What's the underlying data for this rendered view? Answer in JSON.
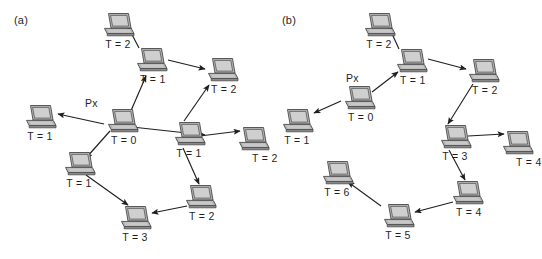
{
  "figure": {
    "width": 537,
    "height": 259,
    "background": "#ffffff",
    "ink": "#1f1f1f",
    "node_icon": "laptop-icon",
    "node_colors": {
      "case": "#b5b5b5",
      "case_shadow": "#8e8e8e",
      "screen": "#cfcfcf",
      "outline": "#4a4a4a"
    }
  },
  "panels": [
    {
      "id": "a",
      "label": "(a)",
      "origin_tag": "Px",
      "nodes": [
        {
          "id": "a-t2-top",
          "label": "T = 2",
          "x": 101,
          "y": 12,
          "label_pos": "center"
        },
        {
          "id": "a-t1-upper",
          "label": "T = 1",
          "x": 134,
          "y": 47,
          "label_pos": "right"
        },
        {
          "id": "a-t2-right",
          "label": "T = 2",
          "x": 205,
          "y": 57,
          "label_pos": "right"
        },
        {
          "id": "a-t1-left",
          "label": "T = 1",
          "x": 23,
          "y": 104,
          "label_pos": "center"
        },
        {
          "id": "a-t0-px",
          "label": "T = 0",
          "x": 105,
          "y": 108,
          "label_pos": "right"
        },
        {
          "id": "a-t1-mid",
          "label": "T = 1",
          "x": 172,
          "y": 121,
          "label_pos": "center"
        },
        {
          "id": "a-t2-far",
          "label": "T = 2",
          "x": 236,
          "y": 126,
          "label_pos": "farright"
        },
        {
          "id": "a-t1-lower",
          "label": "T = 1",
          "x": 62,
          "y": 151,
          "label_pos": "center"
        },
        {
          "id": "a-t2-bottom",
          "label": "T = 2",
          "x": 183,
          "y": 184,
          "label_pos": "right"
        },
        {
          "id": "a-t3",
          "label": "T = 3",
          "x": 118,
          "y": 205,
          "label_pos": "center"
        }
      ],
      "px_tag_pos": {
        "x": 85,
        "y": 97
      },
      "label_pos": {
        "x": 14,
        "y": 14
      },
      "edges": [
        {
          "from": "a-t0-px",
          "to": "a-t1-upper",
          "x1": 130,
          "y1": 113,
          "x2": 146,
          "y2": 76
        },
        {
          "from": "a-t1-upper",
          "to": "a-t2-top",
          "x1": 139,
          "y1": 48,
          "x2": 127,
          "y2": 25
        },
        {
          "from": "a-t1-upper",
          "to": "a-t2-right",
          "x1": 168,
          "y1": 60,
          "x2": 205,
          "y2": 69
        },
        {
          "from": "a-t0-px",
          "to": "a-t1-left",
          "x1": 104,
          "y1": 124,
          "x2": 58,
          "y2": 114
        },
        {
          "from": "a-t0-px",
          "to": "a-t1-mid",
          "x1": 132,
          "y1": 127,
          "x2": 205,
          "y2": 135
        },
        {
          "from": "a-t1-mid",
          "to": "a-t2-right",
          "x1": 184,
          "y1": 121,
          "x2": 209,
          "y2": 85
        },
        {
          "from": "a-t1-mid",
          "to": "a-t2-far",
          "x1": 200,
          "y1": 136,
          "x2": 240,
          "y2": 131
        },
        {
          "from": "a-t0-px",
          "to": "a-t1-lower",
          "x1": 110,
          "y1": 131,
          "x2": 86,
          "y2": 158
        },
        {
          "from": "a-t1-mid",
          "to": "a-t2-bottom",
          "x1": 183,
          "y1": 148,
          "x2": 199,
          "y2": 184
        },
        {
          "from": "a-t1-lower",
          "to": "a-t3",
          "x1": 86,
          "y1": 175,
          "x2": 128,
          "y2": 205
        },
        {
          "from": "a-t2-bottom",
          "to": "a-t3",
          "x1": 187,
          "y1": 206,
          "x2": 152,
          "y2": 213
        }
      ]
    },
    {
      "id": "b",
      "label": "(b)",
      "origin_tag": "Px",
      "nodes": [
        {
          "id": "b-t2-top",
          "label": "T = 2",
          "x": 94,
          "y": 12,
          "label_pos": "center"
        },
        {
          "id": "b-t1",
          "label": "T = 1",
          "x": 126,
          "y": 48,
          "label_pos": "right"
        },
        {
          "id": "b-t2-right",
          "label": "T = 2",
          "x": 198,
          "y": 58,
          "label_pos": "right"
        },
        {
          "id": "b-t0-px",
          "label": "T = 0",
          "x": 74,
          "y": 85,
          "label_pos": "right"
        },
        {
          "id": "b-t1-left",
          "label": "T = 1",
          "x": 12,
          "y": 108,
          "label_pos": "center"
        },
        {
          "id": "b-t3",
          "label": "T = 3",
          "x": 170,
          "y": 124,
          "label_pos": "center"
        },
        {
          "id": "b-t4-right",
          "label": "T = 4",
          "x": 232,
          "y": 130,
          "label_pos": "farright"
        },
        {
          "id": "b-t6",
          "label": "T = 6",
          "x": 52,
          "y": 160,
          "label_pos": "center"
        },
        {
          "id": "b-t4-bot",
          "label": "T = 4",
          "x": 182,
          "y": 180,
          "label_pos": "right"
        },
        {
          "id": "b-t5",
          "label": "T = 5",
          "x": 113,
          "y": 203,
          "label_pos": "center"
        }
      ],
      "px_tag_pos": {
        "x": 78,
        "y": 72
      },
      "label_pos": {
        "x": 14,
        "y": 14
      },
      "edges": [
        {
          "from": "b-t0-px",
          "to": "b-t1",
          "x1": 104,
          "y1": 92,
          "x2": 130,
          "y2": 72
        },
        {
          "from": "b-t1",
          "to": "b-t2-top",
          "x1": 131,
          "y1": 49,
          "x2": 120,
          "y2": 25
        },
        {
          "from": "b-t1",
          "to": "b-t2-right",
          "x1": 160,
          "y1": 59,
          "x2": 198,
          "y2": 69
        },
        {
          "from": "b-t0-px",
          "to": "b-t1-left",
          "x1": 73,
          "y1": 101,
          "x2": 46,
          "y2": 113
        },
        {
          "from": "b-t2-right",
          "to": "b-t3",
          "x1": 205,
          "y1": 84,
          "x2": 180,
          "y2": 124
        },
        {
          "from": "b-t3",
          "to": "b-t4-right",
          "x1": 200,
          "y1": 136,
          "x2": 236,
          "y2": 134
        },
        {
          "from": "b-t3",
          "to": "b-t4-bot",
          "x1": 181,
          "y1": 150,
          "x2": 197,
          "y2": 180
        },
        {
          "from": "b-t4-bot",
          "to": "b-t5",
          "x1": 185,
          "y1": 202,
          "x2": 147,
          "y2": 212
        },
        {
          "from": "b-t5",
          "to": "b-t6",
          "x1": 113,
          "y1": 206,
          "x2": 80,
          "y2": 182
        }
      ]
    }
  ]
}
